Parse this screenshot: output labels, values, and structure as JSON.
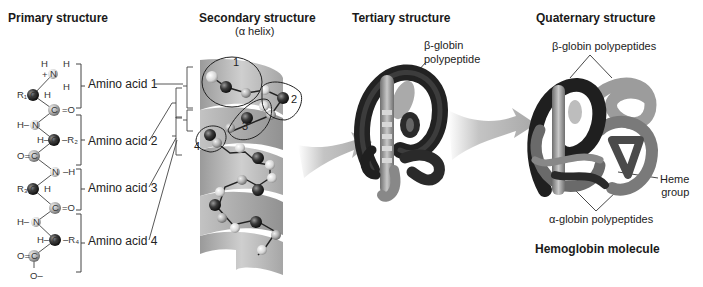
{
  "panels": {
    "primary": {
      "title": "Primary structure",
      "amino_acids": [
        "Amino acid 1",
        "Amino acid 2",
        "Amino acid 3",
        "Amino acid 4"
      ],
      "side_chains": [
        "R1",
        "R2",
        "R3",
        "R4"
      ]
    },
    "secondary": {
      "title": "Secondary structure",
      "subtitle": "(α helix)",
      "residue_numbers": [
        "1",
        "2",
        "3",
        "4"
      ]
    },
    "tertiary": {
      "title": "Tertiary structure",
      "callout_line1": "β-globin",
      "callout_line2": "polypeptide"
    },
    "quaternary": {
      "title": "Quaternary structure",
      "beta_callout": "β-globin polypeptides",
      "alpha_callout": "α-globin polypeptides",
      "heme_line1": "Heme",
      "heme_line2": "group",
      "caption": "Hemoglobin molecule"
    }
  },
  "colors": {
    "ribbon_light": "#c8c8c8",
    "ribbon_dark": "#8e8e8e",
    "atom_dark": "#3a3a3a",
    "atom_light": "#e6e6e6",
    "protein_dark": "#2a2a2a",
    "protein_mid": "#8a8a8a"
  }
}
